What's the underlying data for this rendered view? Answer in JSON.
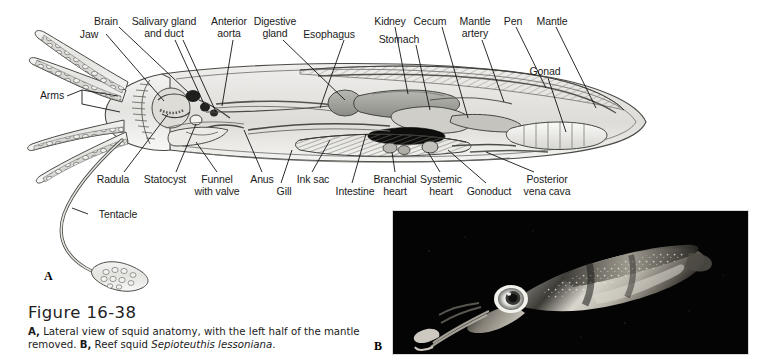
{
  "figure": {
    "number": "Figure 16-38",
    "caption_line1_prefix": "A,",
    "caption_line1": " Lateral view of squid anatomy, with the left half of the mantle",
    "caption_line2_prefix": "removed. ",
    "caption_line2_bold": "B,",
    "caption_line2_mid": " Reef squid ",
    "caption_line2_italic": "Sepioteuthis lessoniana",
    "caption_line2_end": "."
  },
  "panels": {
    "a_letter": "A",
    "b_letter": "B"
  },
  "diagram": {
    "title": "Lateral view of squid anatomy",
    "top_labels": [
      {
        "id": "brain",
        "text": "Brain",
        "x": 106,
        "y": 16
      },
      {
        "id": "jaw",
        "text": "Jaw",
        "x": 89,
        "y": 29
      },
      {
        "id": "salivary-gland",
        "text": "Salivary gland\nand duct",
        "x": 164,
        "y": 16
      },
      {
        "id": "anterior-aorta",
        "text": "Anterior\naorta",
        "x": 229,
        "y": 16
      },
      {
        "id": "digestive-gland",
        "text": "Digestive\ngland",
        "x": 275,
        "y": 16
      },
      {
        "id": "esophagus",
        "text": "Esophagus",
        "x": 329,
        "y": 29
      },
      {
        "id": "kidney",
        "text": "Kidney",
        "x": 390,
        "y": 16
      },
      {
        "id": "stomach",
        "text": "Stomach",
        "x": 399,
        "y": 34
      },
      {
        "id": "cecum",
        "text": "Cecum",
        "x": 430,
        "y": 16
      },
      {
        "id": "mantle-artery",
        "text": "Mantle\nartery",
        "x": 475,
        "y": 16
      },
      {
        "id": "pen",
        "text": "Pen",
        "x": 513,
        "y": 16
      },
      {
        "id": "mantle",
        "text": "Mantle",
        "x": 552,
        "y": 16
      },
      {
        "id": "gonad",
        "text": "Gonad",
        "x": 545,
        "y": 66
      }
    ],
    "left_labels": [
      {
        "id": "arms",
        "text": "Arms",
        "x": 40,
        "y": 95
      },
      {
        "id": "tentacle",
        "text": "Tentacle",
        "x": 92,
        "y": 214
      }
    ],
    "bottom_labels": [
      {
        "id": "radula",
        "text": "Radula",
        "x": 113,
        "y": 174
      },
      {
        "id": "statocyst",
        "text": "Statocyst",
        "x": 163,
        "y": 174
      },
      {
        "id": "funnel-with-valve",
        "text": "Funnel\nwith valve",
        "x": 215,
        "y": 174
      },
      {
        "id": "anus",
        "text": "Anus",
        "x": 256,
        "y": 174
      },
      {
        "id": "gill",
        "text": "Gill",
        "x": 275,
        "y": 186
      },
      {
        "id": "ink-sac",
        "text": "Ink sac",
        "x": 303,
        "y": 174
      },
      {
        "id": "intestine",
        "text": "Intestine",
        "x": 340,
        "y": 186
      },
      {
        "id": "branchial-heart",
        "text": "Branchial\nheart",
        "x": 388,
        "y": 174
      },
      {
        "id": "systemic-heart",
        "text": "Systemic\nheart",
        "x": 434,
        "y": 174
      },
      {
        "id": "gonoduct",
        "text": "Gonoduct",
        "x": 479,
        "y": 186
      },
      {
        "id": "posterior-vena-cava",
        "text": "Posterior\nvena cava",
        "x": 540,
        "y": 174
      }
    ]
  }
}
